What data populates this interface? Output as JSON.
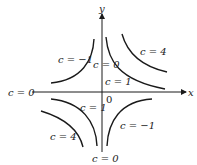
{
  "diagram": {
    "axes": {
      "x_label": "x",
      "y_label": "y",
      "origin_label": "0"
    },
    "curve_labels": {
      "q1_inner": "c = 1",
      "q1_outer": "c = 4",
      "q2": "c = −1",
      "q3_inner": "c = 1",
      "q3_outer": "c = 4",
      "q4": "c = −1",
      "y_axis_top": "c = 0",
      "y_axis_bottom": "c = 0",
      "x_axis_left": "c = 0"
    },
    "curves": [
      {
        "quadrant": 1,
        "c": 1
      },
      {
        "quadrant": 1,
        "c": 4
      },
      {
        "quadrant": 2,
        "c": -1
      },
      {
        "quadrant": 3,
        "c": 1
      },
      {
        "quadrant": 3,
        "c": 4
      },
      {
        "quadrant": 4,
        "c": -1
      }
    ],
    "colors": {
      "ink": "#1a1a1a",
      "background": "#ffffff"
    }
  }
}
